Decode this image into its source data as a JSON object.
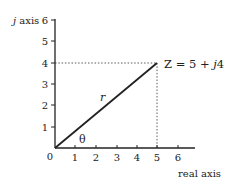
{
  "diagram": {
    "type": "complex-plane-phasor",
    "y_axis_label": "j axis",
    "y_axis_label_italic_part": "j",
    "y_axis_label_rest": " axis",
    "x_axis_label": "real axis",
    "origin_label": "0",
    "x_ticks": [
      "1",
      "2",
      "3",
      "4",
      "5",
      "6"
    ],
    "y_ticks": [
      "1",
      "2",
      "3",
      "4",
      "5",
      "6"
    ],
    "point_label": "Z = 5 + j4",
    "point_label_prefix": "Z = 5 + ",
    "point_label_italic": "j",
    "point_label_suffix": "4",
    "vector_label": "r",
    "angle_label": "θ",
    "point": {
      "x": 5,
      "y": 4
    },
    "colors": {
      "axis": "#222222",
      "vector": "#222222",
      "guide": "#333333"
    }
  }
}
